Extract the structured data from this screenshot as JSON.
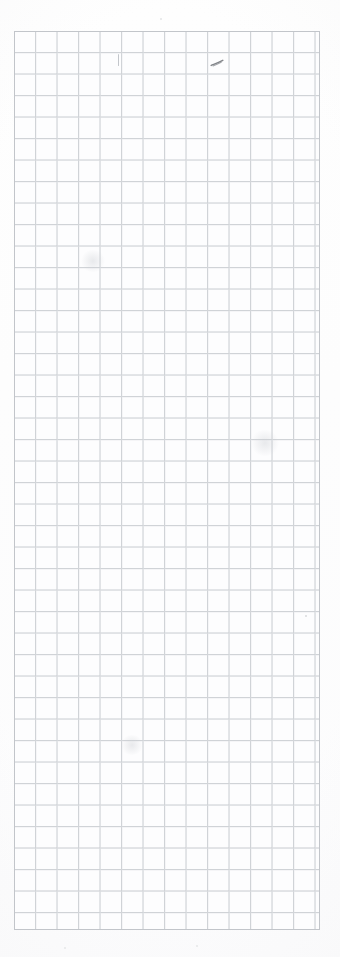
{
  "page": {
    "kind": "grid-paper-sheet",
    "width_px": 340,
    "height_px": 957,
    "background_color": "#fdfdfd",
    "caption": ""
  },
  "sheet": {
    "label": "",
    "left_px": 14,
    "top_px": 31,
    "width_px": 306,
    "height_px": 899,
    "cell_size_px": 21.5,
    "columns": 14,
    "rows": 42,
    "line_color": "#c9ccd1",
    "minor_line_color": "#dfe1e4",
    "border_color": "#c2c5ca",
    "paper_color": "#fdfdfe"
  },
  "annotations": {
    "items": [
      {
        "name": "pencil-tick-mark",
        "type": "tick",
        "left_px": 118,
        "top_px": 54,
        "width_px": 1,
        "height_px": 12,
        "color": "#b9bcc2",
        "text": ""
      },
      {
        "name": "pencil-scribble-mark",
        "type": "scribble",
        "left_px": 210,
        "top_px": 53,
        "width_px": 14,
        "height_px": 8,
        "color": "#75787d",
        "text": ""
      }
    ],
    "specks": [
      {
        "left_px": 305,
        "top_px": 615,
        "size_px": 2,
        "color": "#d9dadd"
      },
      {
        "left_px": 160,
        "top_px": 18,
        "size_px": 2,
        "color": "#e3e4e6"
      },
      {
        "left_px": 64,
        "top_px": 947,
        "size_px": 2,
        "color": "#e6e7e9"
      },
      {
        "left_px": 196,
        "top_px": 945,
        "size_px": 2,
        "color": "#e6e7e9"
      }
    ],
    "smudges": [
      {
        "left_px": 80,
        "top_px": 250,
        "width_px": 26,
        "height_px": 22
      },
      {
        "left_px": 250,
        "top_px": 430,
        "width_px": 30,
        "height_px": 26
      },
      {
        "left_px": 120,
        "top_px": 735,
        "width_px": 24,
        "height_px": 20
      }
    ]
  }
}
